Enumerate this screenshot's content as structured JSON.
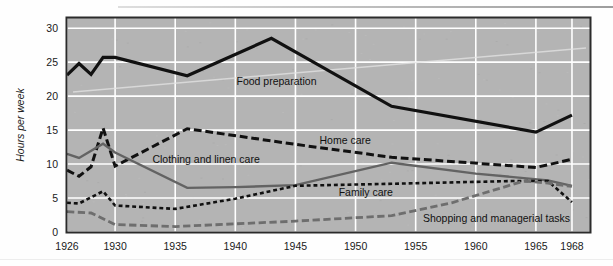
{
  "chart_data": {
    "type": "line",
    "title": "",
    "subtitle": "",
    "xlabel": "",
    "ylabel": "Hours per week",
    "xlim": [
      1926,
      1969.5
    ],
    "ylim": [
      0,
      31.5
    ],
    "grid": true,
    "legend_position": "inline-annotations",
    "background_color": "#b4b4b4",
    "gridline_color": "#ffffff",
    "border_color": "#2b2b2b",
    "x_ticks": [
      1926,
      1930,
      1935,
      1940,
      1945,
      1950,
      1955,
      1960,
      1965,
      1968
    ],
    "x_tick_labels": [
      "1926",
      "1930",
      "1935",
      "1940",
      "1945",
      "1950",
      "1955",
      "1960",
      "1965",
      "1968"
    ],
    "y_ticks": [
      0,
      5,
      10,
      15,
      20,
      25,
      30
    ],
    "y_tick_labels": [
      "0",
      "5",
      "10",
      "15",
      "20",
      "25",
      "30"
    ],
    "series": [
      {
        "name": "Food preparation",
        "color": "#111111",
        "style": "solid",
        "width": 3.2,
        "label_x": 1940.1,
        "label_y": 21.6,
        "x": [
          1926,
          1927,
          1928,
          1929,
          1930,
          1936,
          1943,
          1953,
          1965,
          1968
        ],
        "y": [
          23.1,
          24.8,
          23.2,
          25.7,
          25.7,
          23.0,
          28.5,
          18.5,
          14.7,
          17.2
        ]
      },
      {
        "name": "Home care",
        "color": "#111111",
        "style": "long-dash",
        "width": 3.0,
        "label_x": 1947.0,
        "label_y": 13.0,
        "x": [
          1926,
          1927,
          1928,
          1929,
          1930,
          1936,
          1945,
          1953,
          1965,
          1968
        ],
        "y": [
          9.1,
          8.2,
          9.6,
          15.3,
          9.7,
          15.2,
          12.9,
          11.0,
          9.5,
          10.7
        ]
      },
      {
        "name": "Clothing and linen care",
        "color": "#636363",
        "style": "solid",
        "width": 2.4,
        "label_x": 1933.1,
        "label_y": 10.1,
        "x": [
          1926,
          1927,
          1929,
          1930,
          1936,
          1940,
          1945,
          1953,
          1960,
          1966,
          1968
        ],
        "y": [
          11.5,
          10.9,
          13.0,
          11.7,
          6.5,
          6.6,
          6.9,
          10.2,
          8.6,
          7.6,
          6.8
        ]
      },
      {
        "name": "Family care",
        "color": "#111111",
        "style": "short-dash",
        "width": 2.6,
        "label_x": 1948.6,
        "label_y": 5.3,
        "x": [
          1926,
          1927,
          1929,
          1930,
          1935,
          1940,
          1945,
          1953,
          1963,
          1966,
          1968
        ],
        "y": [
          4.3,
          4.2,
          6.0,
          3.9,
          3.4,
          4.9,
          6.8,
          7.1,
          7.5,
          7.5,
          4.4
        ]
      },
      {
        "name": "Shopping and managerial tasks",
        "color": "#6e6e6e",
        "style": "long-dash",
        "width": 2.8,
        "label_x": 1955.6,
        "label_y": 1.5,
        "x": [
          1926,
          1928,
          1930,
          1935,
          1940,
          1945,
          1950,
          1953,
          1958,
          1964,
          1966,
          1968
        ],
        "y": [
          3.0,
          2.8,
          1.1,
          0.8,
          1.2,
          1.6,
          2.1,
          2.4,
          4.3,
          7.5,
          7.2,
          6.7
        ]
      }
    ]
  }
}
